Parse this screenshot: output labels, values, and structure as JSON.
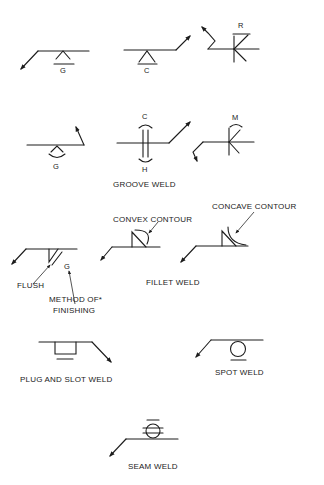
{
  "figure": {
    "type": "welding-symbols-reference",
    "symbols": [
      {
        "id": "groove-ground-arrow-side",
        "letter": "G"
      },
      {
        "id": "groove-chipped-other-side",
        "letter": "C"
      },
      {
        "id": "groove-rolled",
        "letter": "R"
      },
      {
        "id": "groove-convex-ground",
        "letter": "G"
      },
      {
        "id": "groove-double-chipped-hammered",
        "letter_top": "C",
        "letter_bottom": "H"
      },
      {
        "id": "groove-machined",
        "letter": "M"
      },
      {
        "id": "fillet-flush",
        "letter": "G"
      },
      {
        "id": "fillet-convex"
      },
      {
        "id": "fillet-concave"
      },
      {
        "id": "plug-slot"
      },
      {
        "id": "spot"
      },
      {
        "id": "seam"
      }
    ],
    "labels": {
      "groove_weld": "GROOVE WELD",
      "convex_contour": "CONVEX CONTOUR",
      "concave_contour": "CONCAVE CONTOUR",
      "flush": "FLUSH",
      "method_of_finishing_line1": "METHOD OF*",
      "method_of_finishing_line2": "FINISHING",
      "fillet_weld": "FILLET WELD",
      "plug_and_slot_weld": "PLUG AND SLOT WELD",
      "spot_weld": "SPOT WELD",
      "seam_weld": "SEAM WELD"
    },
    "letters": {
      "g1": "G",
      "c1": "C",
      "r1": "R",
      "g2": "G",
      "c2": "C",
      "h2": "H",
      "m2": "M",
      "g3": "G"
    },
    "colors": {
      "ink": "#1c1c1c",
      "background": "#ffffff"
    }
  }
}
